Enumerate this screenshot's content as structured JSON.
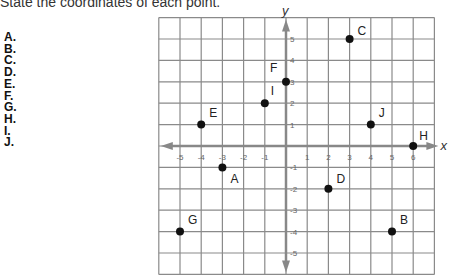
{
  "instruction": "State the coordinates of each point.",
  "answer_labels": [
    "A.",
    "B.",
    "C.",
    "D.",
    "E.",
    "F.",
    "G.",
    "H.",
    "I.",
    "J."
  ],
  "axes": {
    "x_label": "x",
    "y_label": "y",
    "x_ticks": [
      "-5",
      "-4",
      "-3",
      "-2",
      "-1",
      "1",
      "2",
      "3",
      "4",
      "5",
      "6"
    ],
    "y_ticks": [
      "5",
      "4",
      "3",
      "2",
      "1",
      "-1",
      "-2",
      "-3",
      "-4",
      "-5"
    ]
  },
  "chart_data": {
    "type": "scatter",
    "title": "State the coordinates of each point.",
    "xlabel": "x",
    "ylabel": "y",
    "xlim": [
      -6,
      7
    ],
    "ylim": [
      -6,
      6
    ],
    "grid": true,
    "points": [
      {
        "label": "A",
        "x": -3,
        "y": -1
      },
      {
        "label": "B",
        "x": 5,
        "y": -4
      },
      {
        "label": "C",
        "x": 3,
        "y": 5
      },
      {
        "label": "D",
        "x": 2,
        "y": -2
      },
      {
        "label": "E",
        "x": -4,
        "y": 1
      },
      {
        "label": "F",
        "x": 0,
        "y": 3
      },
      {
        "label": "G",
        "x": -5,
        "y": -4
      },
      {
        "label": "H",
        "x": 6,
        "y": 0
      },
      {
        "label": "I",
        "x": -1,
        "y": 2
      },
      {
        "label": "J",
        "x": 4,
        "y": 1
      }
    ]
  }
}
